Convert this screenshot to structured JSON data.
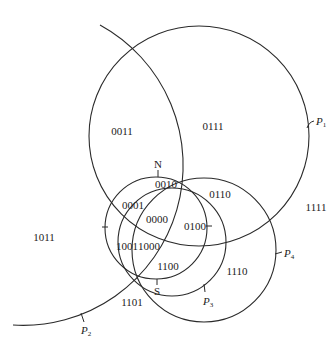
{
  "diagram": {
    "circles": [
      {
        "id": "P1",
        "label": "P",
        "sub": "1"
      },
      {
        "id": "P2",
        "label": "P",
        "sub": "2"
      },
      {
        "id": "P3",
        "label": "P",
        "sub": "3"
      },
      {
        "id": "P4",
        "label": "P",
        "sub": "4"
      }
    ],
    "poles": {
      "north": "N",
      "south": "S"
    },
    "regions": [
      {
        "code": "0011"
      },
      {
        "code": "0111"
      },
      {
        "code": "0010"
      },
      {
        "code": "0110"
      },
      {
        "code": "1111"
      },
      {
        "code": "0001"
      },
      {
        "code": "0000"
      },
      {
        "code": "0100"
      },
      {
        "code": "1011"
      },
      {
        "code": "1001"
      },
      {
        "code": "1000"
      },
      {
        "code": "1100"
      },
      {
        "code": "1110"
      },
      {
        "code": "1101"
      }
    ],
    "stroke_color": "#2a2a2a",
    "background": "#ffffff"
  }
}
